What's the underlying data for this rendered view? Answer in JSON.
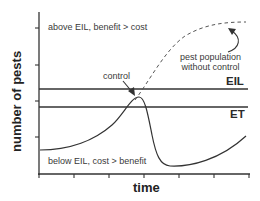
{
  "diagram": {
    "title": "",
    "y_axis_label": "number of pests",
    "x_axis_label": "time",
    "region_above": "above EIL, benefit > cost",
    "region_below": "below EIL, cost > benefit",
    "threshold_lines": [
      {
        "name": "EIL",
        "label": "EIL"
      },
      {
        "name": "ET",
        "label": "ET"
      }
    ],
    "annotations": {
      "control": "control",
      "no_control_line1": "pest population",
      "no_control_line2": "without control"
    },
    "colors": {
      "line": "#333333",
      "dashed": "#555555",
      "text": "#333333",
      "background": "#ffffff"
    }
  }
}
